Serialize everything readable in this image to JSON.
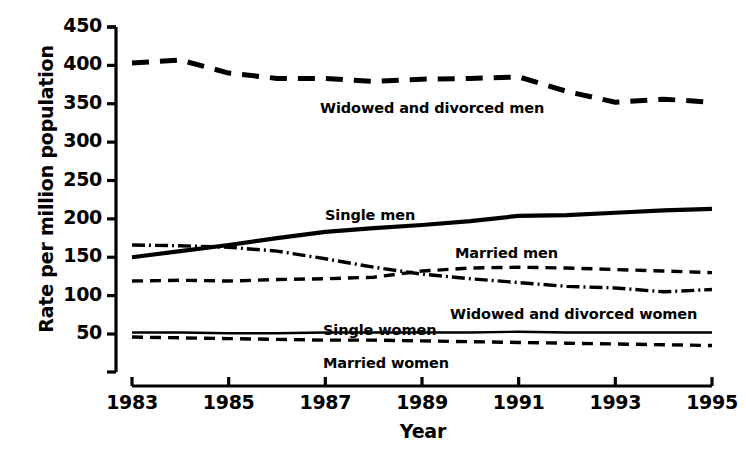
{
  "chart_data": {
    "type": "line",
    "title": "",
    "xlabel": "Year",
    "ylabel": "Rate per million population",
    "xlim": [
      1983,
      1995
    ],
    "ylim": [
      0,
      450
    ],
    "grid": false,
    "legend_position": "inline-annotations",
    "x": [
      1983,
      1984,
      1985,
      1986,
      1987,
      1988,
      1989,
      1990,
      1991,
      1992,
      1993,
      1994,
      1995
    ],
    "ytick_labels": [
      "450",
      "400",
      "350",
      "300",
      "250",
      "200",
      "150",
      "100",
      "50"
    ],
    "ytick_values": [
      450,
      400,
      350,
      300,
      250,
      200,
      150,
      100,
      50
    ],
    "xtick_labels": [
      "1983",
      "1985",
      "1987",
      "1989",
      "1991",
      "1993",
      "1995"
    ],
    "xtick_values": [
      1983,
      1985,
      1987,
      1989,
      1991,
      1993,
      1995
    ],
    "series": [
      {
        "name": "Widowed and divorced men",
        "style": "thick-dashed",
        "color": "#000000",
        "values": [
          403,
          407,
          390,
          383,
          383,
          379,
          382,
          383,
          385,
          366,
          352,
          356,
          352
        ]
      },
      {
        "name": "Single men",
        "style": "thick-solid",
        "color": "#000000",
        "values": [
          150,
          158,
          166,
          175,
          183,
          188,
          192,
          197,
          204,
          205,
          208,
          211,
          213
        ]
      },
      {
        "name": "Widowed and divorced women",
        "style": "dash-dot",
        "color": "#000000",
        "values": [
          166,
          165,
          163,
          158,
          148,
          137,
          128,
          122,
          117,
          112,
          110,
          105,
          108
        ]
      },
      {
        "name": "Married men",
        "style": "dashed",
        "color": "#000000",
        "values": [
          119,
          120,
          119,
          121,
          122,
          124,
          132,
          136,
          137,
          136,
          134,
          132,
          130
        ]
      },
      {
        "name": "Single women",
        "style": "thin-solid",
        "color": "#000000",
        "values": [
          52,
          52,
          51,
          51,
          52,
          52,
          52,
          52,
          53,
          52,
          52,
          52,
          52
        ]
      },
      {
        "name": "Married women",
        "style": "dashed",
        "color": "#000000",
        "values": [
          46,
          45,
          44,
          43,
          42,
          42,
          41,
          40,
          39,
          38,
          37,
          36,
          35
        ]
      }
    ],
    "annotations": [
      {
        "text": "Widowed and divorced men",
        "x_px": 320,
        "y_px": 100
      },
      {
        "text": "Single men",
        "x_px": 325,
        "y_px": 207
      },
      {
        "text": "Married men",
        "x_px": 455,
        "y_px": 245
      },
      {
        "text": "Widowed and divorced women",
        "x_px": 450,
        "y_px": 306
      },
      {
        "text": "Single women",
        "x_px": 323,
        "y_px": 322
      },
      {
        "text": "Married women",
        "x_px": 323,
        "y_px": 355
      }
    ]
  }
}
